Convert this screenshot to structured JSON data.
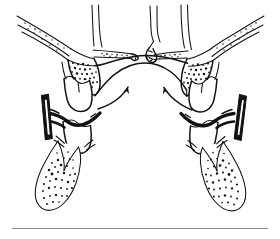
{
  "figure": {
    "type": "line-drawing",
    "caption": "",
    "background_color": "#ffffff",
    "ink_color": "#121212",
    "rule_color": "#8d8d8d",
    "canvas": {
      "width": 280,
      "height": 239
    },
    "parts": {
      "nasal_septum": "nasal-septum",
      "nasal_cavity_left": "left-nasal-cavity",
      "nasal_cavity_right": "right-nasal-cavity",
      "midpalatal_suture": "split-midpalatal-suture",
      "palatal_shelf_left": "left-palatal-shelf",
      "palatal_shelf_right": "right-palatal-shelf",
      "palatal_vault": "palatal-vault-arch",
      "zygomatic_process_left": "left-zygomatic-process",
      "zygomatic_process_right": "right-zygomatic-process",
      "molar_left": "left-maxillary-molar",
      "molar_right": "right-maxillary-molar",
      "premolar_left": "left-maxillary-premolar",
      "premolar_right": "right-maxillary-premolar",
      "root_left": "left-tooth-root",
      "root_right": "right-tooth-root",
      "band_left": "left-expander-band",
      "band_right": "right-expander-band",
      "wire_left": "left-appliance-wire",
      "wire_right": "right-appliance-wire",
      "arrow_left": "left-force-arrow",
      "arrow_right": "right-force-arrow",
      "rule": "bottom-rule"
    },
    "arrows": {
      "count": 2,
      "left_label": "",
      "right_label": "",
      "direction": "outward-upward",
      "meaning": "direction of expansion force"
    },
    "bone_stipple": {
      "description": "cancellous bone stippling",
      "regions": [
        "left-maxilla",
        "right-maxilla",
        "left-root",
        "right-root",
        "palatal-shelves"
      ]
    }
  }
}
